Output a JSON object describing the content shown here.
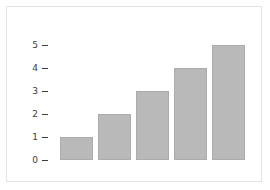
{
  "figure": {
    "background_color": "#ffffff",
    "frame_color": "#e3e3e3",
    "bar_fill_color": "#b9b9b9",
    "bar_border_color": "#acacac",
    "tick_color": "#3c3c3c"
  },
  "chart_data": {
    "type": "bar",
    "title": "",
    "subtitle": "",
    "xlabel": "",
    "ylabel": "",
    "categories": [
      "1",
      "2",
      "3",
      "4",
      "5"
    ],
    "values": [
      1,
      2,
      3,
      4,
      5
    ],
    "ylim": [
      0,
      5.4
    ],
    "yticks": [
      0,
      1,
      2,
      3,
      4,
      5
    ],
    "ytick_labels": [
      "0",
      "1",
      "2",
      "3",
      "4",
      "5"
    ],
    "xticks": [],
    "xtick_labels": [],
    "grid": false,
    "legend": null,
    "legend_position": "none",
    "annotations": []
  }
}
